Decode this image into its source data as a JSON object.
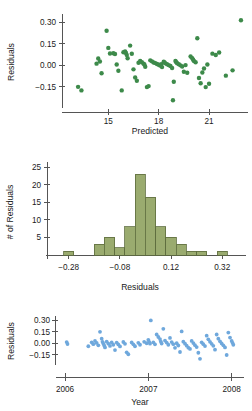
{
  "figure": {
    "background_color": "#ffffff",
    "axis_color": "#555555",
    "text_color": "#1a1a1a"
  },
  "chart_data": [
    {
      "id": "residuals-vs-predicted",
      "type": "scatter",
      "title": "",
      "xlabel": "Predicted",
      "ylabel": "Residuals",
      "xlim": [
        12.6,
        23.2
      ],
      "ylim": [
        -0.27,
        0.345
      ],
      "xticks": [
        15,
        18,
        21
      ],
      "xtick_labels": [
        "15",
        "18",
        "21"
      ],
      "yticks": [
        -0.15,
        0.0,
        0.15,
        0.3
      ],
      "ytick_labels": [
        "-0.15",
        "0.00",
        "0.15",
        "0.30"
      ],
      "grid": false,
      "legend": "none",
      "marker_color": "#3d8a4a",
      "marker_size": 2.2,
      "points": [
        [
          13.2,
          -0.15
        ],
        [
          13.4,
          -0.175
        ],
        [
          14.3,
          0.012
        ],
        [
          14.4,
          0.048
        ],
        [
          14.5,
          0.027
        ],
        [
          14.6,
          -0.055
        ],
        [
          14.9,
          0.242
        ],
        [
          15.0,
          0.122
        ],
        [
          15.1,
          0.083
        ],
        [
          15.3,
          0.085
        ],
        [
          15.4,
          0.079
        ],
        [
          15.5,
          0.006
        ],
        [
          15.6,
          -0.038
        ],
        [
          15.8,
          -0.175
        ],
        [
          15.9,
          0.092
        ],
        [
          16.0,
          0.098
        ],
        [
          16.05,
          0.086
        ],
        [
          16.1,
          0.073
        ],
        [
          16.15,
          0.05
        ],
        [
          16.3,
          0.138
        ],
        [
          16.4,
          0.081
        ],
        [
          16.5,
          -0.028
        ],
        [
          16.6,
          -0.085
        ],
        [
          16.7,
          -0.108
        ],
        [
          16.8,
          0.018
        ],
        [
          16.9,
          0.03
        ],
        [
          17.0,
          0.022
        ],
        [
          17.1,
          0.012
        ],
        [
          17.15,
          0.006
        ],
        [
          17.2,
          -0.01
        ],
        [
          17.3,
          -0.152
        ],
        [
          17.4,
          -0.145
        ],
        [
          17.5,
          0.035
        ],
        [
          17.6,
          0.028
        ],
        [
          17.7,
          0.02
        ],
        [
          17.8,
          0.016
        ],
        [
          17.9,
          0.01
        ],
        [
          18.0,
          0.004
        ],
        [
          18.1,
          -0.002
        ],
        [
          18.15,
          0.008
        ],
        [
          18.2,
          -0.012
        ],
        [
          18.3,
          0.026
        ],
        [
          18.35,
          0.02
        ],
        [
          18.4,
          0.014
        ],
        [
          18.5,
          0.008
        ],
        [
          18.6,
          0.002
        ],
        [
          18.7,
          -0.004
        ],
        [
          18.8,
          -0.018
        ],
        [
          18.85,
          -0.244
        ],
        [
          18.9,
          -0.115
        ],
        [
          19.0,
          0.03
        ],
        [
          19.05,
          0.022
        ],
        [
          19.1,
          0.015
        ],
        [
          19.2,
          0.008
        ],
        [
          19.3,
          0.0
        ],
        [
          19.4,
          -0.008
        ],
        [
          19.5,
          -0.045
        ],
        [
          19.6,
          0.002
        ],
        [
          19.7,
          -0.052
        ],
        [
          19.9,
          0.062
        ],
        [
          20.0,
          0.05
        ],
        [
          20.05,
          0.04
        ],
        [
          20.1,
          0.03
        ],
        [
          20.2,
          0.022
        ],
        [
          20.3,
          0.19
        ],
        [
          20.4,
          -0.088
        ],
        [
          20.5,
          -0.125
        ],
        [
          20.6,
          -0.05
        ],
        [
          20.7,
          -0.022
        ],
        [
          20.8,
          -0.152
        ],
        [
          20.9,
          0.006
        ],
        [
          21.0,
          -0.128
        ],
        [
          21.2,
          0.082
        ],
        [
          21.4,
          0.072
        ],
        [
          21.6,
          0.09
        ],
        [
          22.0,
          -0.072
        ],
        [
          22.4,
          -0.035
        ],
        [
          22.9,
          0.315
        ]
      ]
    },
    {
      "id": "histogram-of-residuals",
      "type": "bar",
      "title": "",
      "xlabel": "Residuals",
      "ylabel": "# of Residuals",
      "xlim": [
        -0.345,
        0.405
      ],
      "ylim": [
        0,
        26.5
      ],
      "xticks": [
        -0.28,
        -0.08,
        0.12,
        0.32
      ],
      "xtick_labels": [
        "-0.28",
        "-0.08",
        "0.12",
        "0.32"
      ],
      "yticks": [
        5,
        10,
        15,
        20,
        25
      ],
      "ytick_labels": [
        "5",
        "10",
        "15",
        "20",
        "25"
      ],
      "grid": false,
      "legend": "none",
      "bar_fill": "#9aab6f",
      "bar_stroke": "#5d6b3d",
      "bin_width": 0.04,
      "bin_starts": [
        -0.3,
        -0.26,
        -0.22,
        -0.18,
        -0.14,
        -0.1,
        -0.06,
        -0.02,
        0.02,
        0.06,
        0.1,
        0.14,
        0.18,
        0.22,
        0.26,
        0.3
      ],
      "categories": [
        "-0.30",
        "-0.26",
        "-0.22",
        "-0.18",
        "-0.14",
        "-0.10",
        "-0.06",
        "-0.02",
        "0.02",
        "0.06",
        "0.10",
        "0.14",
        "0.18",
        "0.22",
        "0.26",
        "0.30"
      ],
      "values": [
        1,
        0,
        0,
        3,
        5,
        2,
        8,
        23,
        16.5,
        8,
        5,
        3,
        1,
        1,
        0,
        1
      ]
    },
    {
      "id": "residuals-vs-year",
      "type": "scatter",
      "title": "",
      "xlabel": "Year",
      "ylabel": "Residuals",
      "xlim": [
        2005.94,
        2008.1
      ],
      "ylim": [
        -0.26,
        0.345
      ],
      "xticks": [
        2006,
        2007,
        2008
      ],
      "xtick_labels": [
        "2006",
        "2007",
        "2008"
      ],
      "yticks": [
        -0.15,
        0.0,
        0.15,
        0.3
      ],
      "ytick_labels": [
        "-0.15",
        "0.00",
        "0.15",
        "0.30"
      ],
      "grid": false,
      "legend": "none",
      "marker_color": "#6fa8dc",
      "marker_size": 1.9,
      "points": [
        [
          2006.02,
          0.015
        ],
        [
          2006.03,
          -0.01
        ],
        [
          2006.28,
          -0.04
        ],
        [
          2006.32,
          0.012
        ],
        [
          2006.34,
          -0.012
        ],
        [
          2006.36,
          0.03
        ],
        [
          2006.38,
          0.004
        ],
        [
          2006.4,
          -0.028
        ],
        [
          2006.42,
          0.15
        ],
        [
          2006.44,
          0.06
        ],
        [
          2006.45,
          0.018
        ],
        [
          2006.46,
          -0.005
        ],
        [
          2006.47,
          -0.03
        ],
        [
          2006.48,
          -0.055
        ],
        [
          2006.5,
          0.022
        ],
        [
          2006.52,
          -0.006
        ],
        [
          2006.54,
          -0.035
        ],
        [
          2006.56,
          0.01
        ],
        [
          2006.58,
          -0.02
        ],
        [
          2006.6,
          -0.09
        ],
        [
          2006.62,
          0.008
        ],
        [
          2006.64,
          -0.016
        ],
        [
          2006.66,
          -0.042
        ],
        [
          2006.7,
          0.016
        ],
        [
          2006.72,
          -0.008
        ],
        [
          2006.74,
          -0.12
        ],
        [
          2006.76,
          -0.145
        ],
        [
          2006.8,
          0.01
        ],
        [
          2006.82,
          -0.014
        ],
        [
          2006.84,
          -0.04
        ],
        [
          2006.88,
          0.006
        ],
        [
          2006.9,
          -0.02
        ],
        [
          2006.95,
          0.018
        ],
        [
          2006.98,
          0.0
        ],
        [
          2007.0,
          0.045
        ],
        [
          2007.01,
          0.018
        ],
        [
          2007.02,
          -0.006
        ],
        [
          2007.03,
          0.3
        ],
        [
          2007.06,
          0.012
        ],
        [
          2007.08,
          -0.015
        ],
        [
          2007.1,
          0.115
        ],
        [
          2007.12,
          0.082
        ],
        [
          2007.14,
          0.055
        ],
        [
          2007.15,
          0.022
        ],
        [
          2007.16,
          -0.005
        ],
        [
          2007.18,
          0.19
        ],
        [
          2007.2,
          0.035
        ],
        [
          2007.22,
          0.008
        ],
        [
          2007.24,
          -0.02
        ],
        [
          2007.26,
          0.07
        ],
        [
          2007.28,
          0.015
        ],
        [
          2007.3,
          -0.012
        ],
        [
          2007.32,
          -0.06
        ],
        [
          2007.34,
          0.0
        ],
        [
          2007.36,
          -0.03
        ],
        [
          2007.38,
          -0.115
        ],
        [
          2007.4,
          0.155
        ],
        [
          2007.42,
          0.02
        ],
        [
          2007.44,
          -0.006
        ],
        [
          2007.46,
          -0.032
        ],
        [
          2007.48,
          -0.058
        ],
        [
          2007.5,
          -0.075
        ],
        [
          2007.52,
          0.03
        ],
        [
          2007.54,
          0.002
        ],
        [
          2007.56,
          -0.025
        ],
        [
          2007.58,
          -0.05
        ],
        [
          2007.6,
          -0.125
        ],
        [
          2007.62,
          -0.205
        ],
        [
          2007.64,
          0.012
        ],
        [
          2007.66,
          -0.012
        ],
        [
          2007.68,
          -0.038
        ],
        [
          2007.7,
          0.1
        ],
        [
          2007.72,
          0.052
        ],
        [
          2007.74,
          0.018
        ],
        [
          2007.76,
          -0.008
        ],
        [
          2007.78,
          -0.034
        ],
        [
          2007.8,
          -0.085
        ],
        [
          2007.82,
          0.115
        ],
        [
          2007.84,
          0.06
        ],
        [
          2007.86,
          0.025
        ],
        [
          2007.88,
          -0.002
        ],
        [
          2007.9,
          -0.028
        ],
        [
          2007.92,
          -0.055
        ],
        [
          2007.94,
          -0.155
        ],
        [
          2007.96,
          0.14
        ],
        [
          2007.98,
          0.075
        ],
        [
          2008.0,
          0.03
        ],
        [
          2008.01,
          0.005
        ],
        [
          2008.02,
          -0.02
        ]
      ]
    }
  ]
}
